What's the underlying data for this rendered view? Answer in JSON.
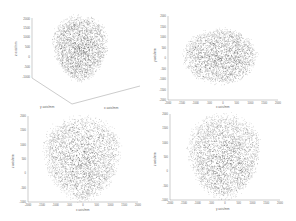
{
  "chart_data": [
    {
      "type": "scatter",
      "view": "3d",
      "title": "",
      "xlabel": "x axis/mm",
      "ylabel": "y axis/mm",
      "zlabel": "z axis/mm",
      "zticks": [
        "2000",
        "1500",
        "1000",
        "500",
        "0",
        "-500",
        "-1000"
      ],
      "xticks": [
        "2000",
        "1000",
        "0",
        "-1000",
        "-2000"
      ],
      "yticks": [
        "2000",
        "1000",
        "0",
        "-1000",
        "-2000"
      ],
      "shape": "egg-shaped head point cloud",
      "point_color": "#3a3a3a"
    },
    {
      "type": "scatter",
      "view": "top (x-y)",
      "xlabel": "x axis/mm",
      "ylabel": "y axis/mm",
      "xticks": [
        "-2000",
        "-1500",
        "-1000",
        "-500",
        "0",
        "500",
        "1000",
        "1500",
        "2000"
      ],
      "yticks": [
        "2000",
        "1500",
        "1000",
        "500",
        "0",
        "-500",
        "-1000",
        "-1500",
        "-2000"
      ],
      "xlim": [
        -2000,
        2000
      ],
      "ylim": [
        -2000,
        2000
      ],
      "shape": "ellipse centered at origin, rx≈1250, ry≈1000",
      "point_color": "#3a3a3a"
    },
    {
      "type": "scatter",
      "view": "front (x-z)",
      "xlabel": "x axis/mm",
      "ylabel": "z axis/mm",
      "xticks": [
        "-2000",
        "-1500",
        "-1000",
        "-500",
        "0",
        "500",
        "1000",
        "1500",
        "2000"
      ],
      "yticks": [
        "2000",
        "1500",
        "1000",
        "500",
        "0",
        "-500",
        "-1000"
      ],
      "xlim": [
        -2000,
        2000
      ],
      "ylim": [
        -1000,
        2000
      ],
      "shape": "inverted egg, width≈2600, z from -1000 to 2000",
      "point_color": "#3a3a3a"
    },
    {
      "type": "scatter",
      "view": "side (y-z)",
      "xlabel": "y axis/mm",
      "ylabel": "z axis/mm",
      "xticks": [
        "-2000",
        "-1500",
        "-1000",
        "-500",
        "0",
        "500",
        "1000",
        "1500",
        "2000"
      ],
      "yticks": [
        "2000",
        "1500",
        "1000",
        "500",
        "0",
        "-500",
        "-1000"
      ],
      "xlim": [
        -2000,
        2000
      ],
      "ylim": [
        -1000,
        2000
      ],
      "shape": "inverted egg, width≈2400, z from -1000 to 2000",
      "point_color": "#3a3a3a"
    }
  ]
}
